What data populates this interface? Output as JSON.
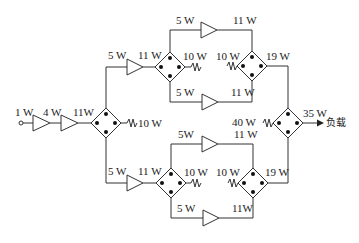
{
  "diagram": {
    "type": "power-combining amplifier network",
    "input": {
      "power": "1 W"
    },
    "stages": {
      "driver1_out": "4 W",
      "driver2_out": "11W",
      "splitter1_load": "10 W"
    },
    "upper": {
      "amp_in": "5 W",
      "amp_out": "11 W",
      "splitter_load": "10 W",
      "top_amp_in": "5 W",
      "top_amp_out": "11 W",
      "bottom_amp_in": "5 W",
      "bottom_amp_out": "11 W",
      "combiner_load": "10 W",
      "combiner_out": "19 W"
    },
    "lower": {
      "amp_in": "5 W",
      "amp_out": "11 W",
      "splitter_load": "10 W",
      "top_amp_in": "5W",
      "top_amp_out": "11 W",
      "bottom_amp_in": "5 W",
      "bottom_amp_out": "11W",
      "combiner_load": "10 W",
      "combiner_out": "19 W"
    },
    "final": {
      "combiner_load": "40 W",
      "output": "35 W",
      "load_label": "负载"
    }
  }
}
